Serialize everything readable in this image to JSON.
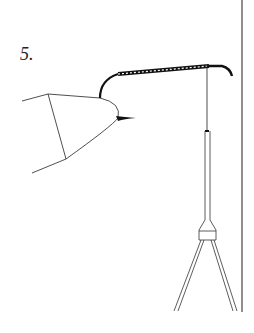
{
  "figure": {
    "step_label": "5.",
    "colors": {
      "line": "#222222",
      "background": "#ffffff",
      "wrap": "#111111"
    }
  }
}
